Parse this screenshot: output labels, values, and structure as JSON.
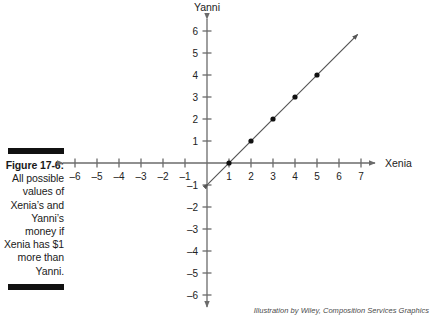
{
  "caption": {
    "figure_number": "Figure 17-6:",
    "text": " All possible values of Xenia’s and Yanni’s money if Xenia has $1 more than Yanni."
  },
  "attribution": "Illustration by Wiley, Composition Services Graphics",
  "chart_data": {
    "type": "scatter",
    "title": "",
    "xlabel": "Xenia",
    "ylabel": "Yanni",
    "xlim": [
      -6,
      7
    ],
    "ylim": [
      -6,
      6
    ],
    "grid": false,
    "legend": "none",
    "x_ticks": [
      -6,
      -5,
      -4,
      -3,
      -2,
      -1,
      1,
      2,
      3,
      4,
      5,
      6,
      7
    ],
    "y_ticks": [
      6,
      5,
      4,
      3,
      2,
      1,
      -1,
      -2,
      -3,
      -4,
      -5,
      -6
    ],
    "x_tick_labels": [
      "–6",
      "–5",
      "–4",
      "–3",
      "–2",
      "–1",
      "1",
      "2",
      "3",
      "4",
      "5",
      "6",
      "7"
    ],
    "y_tick_labels": [
      "6",
      "5",
      "4",
      "3",
      "2",
      "1",
      "–1",
      "–2",
      "–3",
      "–4",
      "–5",
      "–6"
    ],
    "series": [
      {
        "name": "Yanni = Xenia − 1",
        "kind": "line-with-points",
        "equation": "y = x − 1",
        "color": "#555555",
        "double_arrow": true,
        "x": [
          1,
          2,
          3,
          4,
          5
        ],
        "values": [
          0,
          1,
          2,
          3,
          4
        ],
        "points": [
          {
            "x": 1,
            "y": 0
          },
          {
            "x": 2,
            "y": 1
          },
          {
            "x": 3,
            "y": 2
          },
          {
            "x": 4,
            "y": 3
          },
          {
            "x": 5,
            "y": 4
          }
        ],
        "line_endpoints": [
          {
            "x": 0.05,
            "y": -0.95
          },
          {
            "x": 6.85,
            "y": 5.85
          }
        ]
      }
    ],
    "annotations": []
  }
}
